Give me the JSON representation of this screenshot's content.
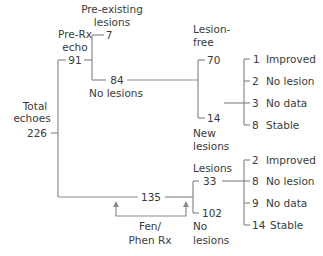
{
  "root": {
    "label_line1": "Total",
    "label_line2": "echoes",
    "count": "226"
  },
  "pre_rx": {
    "label_line1": "Pre-Rx",
    "label_line2": "echo",
    "count": "91",
    "pre_existing": {
      "label_line1": "Pre-existing",
      "label_line2": "lesions",
      "count": "7"
    },
    "no_lesions": {
      "count": "84",
      "label": "No lesions",
      "lesion_free": {
        "label_line1": "Lesion-",
        "label_line2": "free",
        "count": "70"
      },
      "new_lesions": {
        "label_line1": "New",
        "label_line2": "lesions",
        "count": "14",
        "outcomes": [
          {
            "count": "1",
            "label": "Improved"
          },
          {
            "count": "2",
            "label": "No lesion"
          },
          {
            "count": "3",
            "label": "No data"
          },
          {
            "count": "8",
            "label": "Stable"
          }
        ]
      }
    }
  },
  "fen_phen": {
    "count": "135",
    "treatment_line1": "Fen/",
    "treatment_line2": "Phen Rx",
    "lesions": {
      "label": "Lesions",
      "count": "33",
      "outcomes": [
        {
          "count": "2",
          "label": "Improved"
        },
        {
          "count": "8",
          "label": "No lesion"
        },
        {
          "count": "9",
          "label": "No data"
        },
        {
          "count": "14",
          "label": "Stable"
        }
      ]
    },
    "no_lesions": {
      "count": "102",
      "label_line1": "No",
      "label_line2": "lesions"
    }
  }
}
